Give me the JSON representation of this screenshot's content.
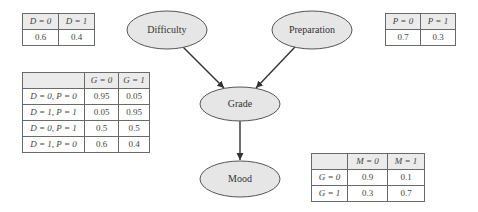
{
  "nodes": {
    "difficulty": "Difficulty",
    "preparation": "Preparation",
    "grade": "Grade",
    "mood": "Mood"
  },
  "edges": [
    {
      "from": "Difficulty",
      "to": "Grade"
    },
    {
      "from": "Preparation",
      "to": "Grade"
    },
    {
      "from": "Grade",
      "to": "Mood"
    }
  ],
  "colors": {
    "node_fill": "#e6e6e6",
    "node_stroke": "#555555",
    "edge": "#333333",
    "table_header_bg": "#ebebeb",
    "table_border": "#6a6a6a"
  },
  "cpt_difficulty": {
    "headers": [
      "D = 0",
      "D = 1"
    ],
    "values": [
      "0.6",
      "0.4"
    ]
  },
  "cpt_preparation": {
    "headers": [
      "P = 0",
      "P = 1"
    ],
    "values": [
      "0.7",
      "0.3"
    ]
  },
  "cpt_grade": {
    "headers": [
      "",
      "G = 0",
      "G = 1"
    ],
    "rows": [
      {
        "cond": "D = 0, P = 0",
        "g0": "0.95",
        "g1": "0.05"
      },
      {
        "cond": "D = 1, P = 1",
        "g0": "0.05",
        "g1": "0.95"
      },
      {
        "cond": "D = 0, P = 1",
        "g0": "0.5",
        "g1": "0.5"
      },
      {
        "cond": "D = 1, P = 0",
        "g0": "0.6",
        "g1": "0.4"
      }
    ]
  },
  "cpt_mood": {
    "headers": [
      "",
      "M = 0",
      "M = 1"
    ],
    "rows": [
      {
        "cond": "G = 0",
        "m0": "0.9",
        "m1": "0.1"
      },
      {
        "cond": "G = 1",
        "m0": "0.3",
        "m1": "0.7"
      }
    ]
  }
}
